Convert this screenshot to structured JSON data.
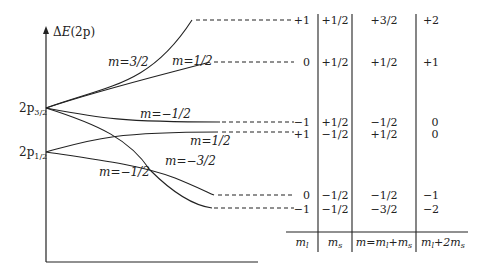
{
  "diagram": {
    "axis": {
      "y_label_prefix": "Δ",
      "y_label_var": "E",
      "y_label_suffix": "(2p)"
    },
    "levels": [
      {
        "base": "2p",
        "sub": "3/2"
      },
      {
        "base": "2p",
        "sub": "1/2"
      }
    ],
    "curve_labels": [
      {
        "text": "m=3/2"
      },
      {
        "text": "m=1/2"
      },
      {
        "text": "m=−1/2"
      },
      {
        "text": "m=1/2"
      },
      {
        "text": "m=−3/2"
      },
      {
        "text": "m=−1/2"
      }
    ],
    "table": {
      "headers": [
        "m_l",
        "m_s",
        "m=m_l+m_s",
        "m_l+2m_s"
      ],
      "header_parts": {
        "ml": {
          "v": "m",
          "s": "l"
        },
        "ms": {
          "v": "m",
          "s": "s"
        },
        "m_sum": {
          "a": "m=m",
          "b": "l",
          "c": "+m",
          "d": "s"
        },
        "ml2ms": {
          "a": "m",
          "b": "l",
          "c": "+2m",
          "d": "s"
        }
      },
      "rows": [
        {
          "ml": "+1",
          "ms": "+1/2",
          "m": "+3/2",
          "ml2ms": "+2"
        },
        {
          "ml": "0",
          "ms": "+1/2",
          "m": "+1/2",
          "ml2ms": "+1"
        },
        {
          "ml": "−1",
          "ms": "+1/2",
          "m": "−1/2",
          "ml2ms": "0"
        },
        {
          "ml": "+1",
          "ms": "−1/2",
          "m": "+1/2",
          "ml2ms": "0"
        },
        {
          "ml": "0",
          "ms": "−1/2",
          "m": "−1/2",
          "ml2ms": "−1"
        },
        {
          "ml": "−1",
          "ms": "−1/2",
          "m": "−3/2",
          "ml2ms": "−2"
        }
      ]
    }
  }
}
